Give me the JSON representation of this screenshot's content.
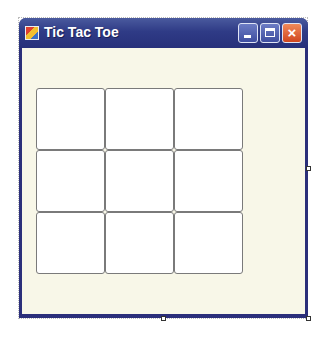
{
  "window": {
    "title": "Tic Tac Toe",
    "icon": "app-icon",
    "controls": {
      "minimize": "minimize-icon",
      "maximize": "maximize-icon",
      "close": "×"
    }
  },
  "board": {
    "rows": 3,
    "cols": 3,
    "cells": [
      "",
      "",
      "",
      "",
      "",
      "",
      "",
      "",
      ""
    ]
  },
  "colors": {
    "titlebar": "#2f3b86",
    "client": "#f8f7e8",
    "close_button": "#d0461e",
    "cell_border": "#7a7a7a"
  }
}
